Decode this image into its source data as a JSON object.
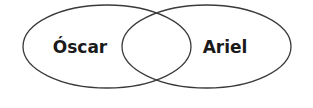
{
  "diagram": {
    "type": "venn",
    "sets": [
      {
        "label": "Óscar"
      },
      {
        "label": "Ariel"
      }
    ],
    "intersection_label": "",
    "colors": {
      "stroke": "#3a3a3a",
      "fill": "#ffffff",
      "text": "#1a1a1a"
    }
  }
}
